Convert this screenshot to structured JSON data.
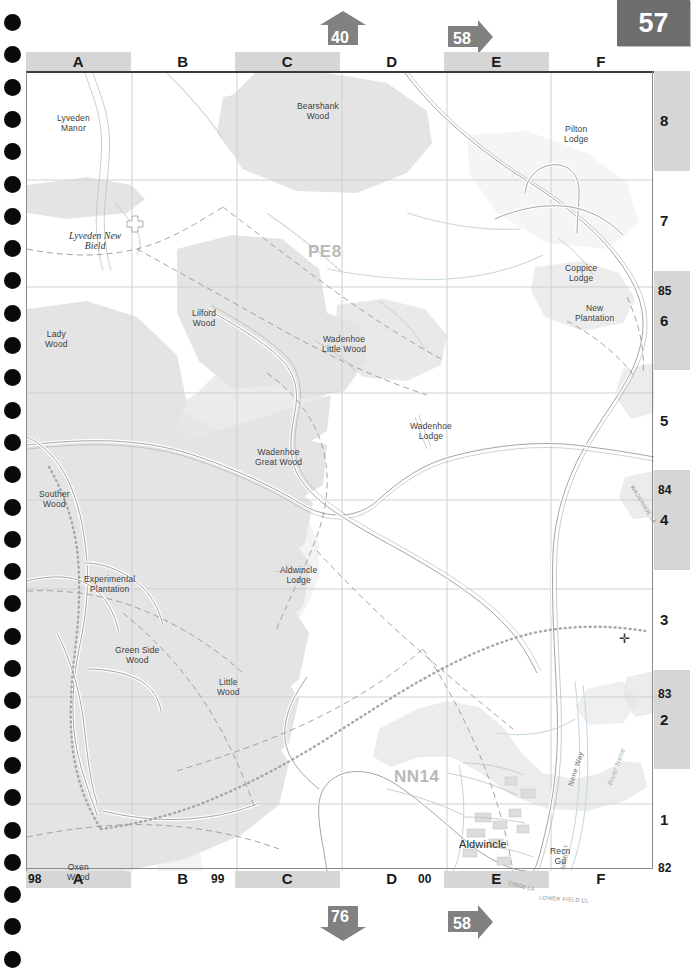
{
  "page": {
    "number": "57"
  },
  "nav_arrows": [
    {
      "name": "top-up-40",
      "label": "40",
      "direction": "up"
    },
    {
      "name": "top-right-58",
      "label": "58",
      "direction": "right"
    },
    {
      "name": "bottom-down-76",
      "label": "76",
      "direction": "down"
    },
    {
      "name": "bottom-right-58",
      "label": "58",
      "direction": "right"
    }
  ],
  "grid": {
    "columns": [
      "A",
      "B",
      "C",
      "D",
      "E",
      "F"
    ],
    "rows": [
      "8",
      "7",
      "6",
      "5",
      "4",
      "3",
      "2",
      "1"
    ],
    "eastings": [
      "98",
      "99",
      "00"
    ],
    "northings": [
      "85",
      "84",
      "83",
      "82"
    ]
  },
  "map": {
    "postcodes": [
      {
        "label": "PE8",
        "x": 281,
        "y": 175
      },
      {
        "label": "NN14",
        "x": 367,
        "y": 700
      }
    ],
    "settlements": [
      {
        "label": "Aldwincle",
        "x": 432,
        "y": 768
      }
    ],
    "historic": [
      {
        "label": "Lyveden New\nBield",
        "x": 42,
        "y": 160
      }
    ],
    "places": [
      {
        "label": "Lyveden\nManor",
        "x": 30,
        "y": 42
      },
      {
        "label": "Bearshank\nWood",
        "x": 270,
        "y": 30
      },
      {
        "label": "Pilton\nLodge",
        "x": 537,
        "y": 53
      },
      {
        "label": "Coppice\nLodge",
        "x": 538,
        "y": 192
      },
      {
        "label": "New\nPlantation",
        "x": 548,
        "y": 232
      },
      {
        "label": "Lilford\nWood",
        "x": 165,
        "y": 237
      },
      {
        "label": "Lady\nWood",
        "x": 18,
        "y": 258
      },
      {
        "label": "Wadenhoe\nLittle Wood",
        "x": 295,
        "y": 263
      },
      {
        "label": "Wadenhoe\nLodge",
        "x": 383,
        "y": 350
      },
      {
        "label": "Wadenhoe\nGreat Wood",
        "x": 228,
        "y": 376
      },
      {
        "label": "Souther\nWood",
        "x": 12,
        "y": 418
      },
      {
        "label": "Experimental\nPlantation",
        "x": 57,
        "y": 503
      },
      {
        "label": "Aldwincle\nLodge",
        "x": 253,
        "y": 494
      },
      {
        "label": "Green Side\nWood",
        "x": 88,
        "y": 574
      },
      {
        "label": "Little\nWood",
        "x": 190,
        "y": 606
      },
      {
        "label": "Recn\nGd",
        "x": 523,
        "y": 775
      },
      {
        "label": "Oxen\nWood",
        "x": 40,
        "y": 791
      }
    ],
    "linear_features": [
      {
        "label": "Nene Way",
        "x": 531,
        "y": 692,
        "rotation": -72
      },
      {
        "label": "River Nene",
        "x": 570,
        "y": 690,
        "rotation": -70
      },
      {
        "label": "WADENHOE LA",
        "x": 594,
        "y": 428,
        "rotation": 58
      },
      {
        "label": "MAIN ST",
        "x": 526,
        "y": 780,
        "rotation": -82
      },
      {
        "label": "C6008 LA",
        "x": 481,
        "y": 810,
        "rotation": 14
      },
      {
        "label": "LOWER FIELD CL",
        "x": 512,
        "y": 823,
        "rotation": 4
      }
    ],
    "marker": {
      "name": "cross-marker",
      "x": 592,
      "y": 560,
      "glyph": "✛"
    }
  },
  "colors": {
    "tab_background": "#6e6e6e",
    "arrow_fill": "#818181",
    "ruler_shade": "#d6d6d6",
    "woodland": "#e4e4e4",
    "grid_line": "#c9c9c9",
    "road_line": "#b5b5b5"
  }
}
